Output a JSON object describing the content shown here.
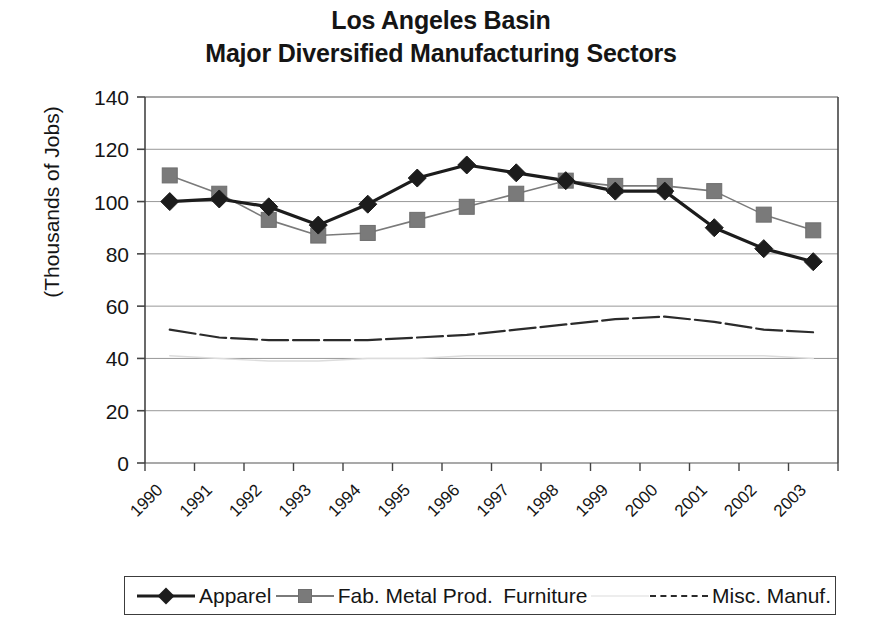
{
  "chart_data": {
    "type": "line",
    "title": "Los Angeles Basin",
    "subtitle": "Major Diversified Manufacturing Sectors",
    "title_lines": [
      "Los Angeles Basin",
      "Major Diversified Manufacturing Sectors"
    ],
    "xlabel": "",
    "ylabel": "(Thousands of Jobs)",
    "ylim": [
      0,
      140
    ],
    "ytick_step": 20,
    "ytick_labels": [
      "140",
      "120",
      "100",
      "80",
      "60",
      "40",
      "20",
      "0"
    ],
    "ytick_values": [
      140,
      120,
      100,
      80,
      60,
      40,
      20,
      0
    ],
    "categories": [
      "1990",
      "1991",
      "1992",
      "1993",
      "1994",
      "1995",
      "1996",
      "1997",
      "1998",
      "1999",
      "2000",
      "2001",
      "2002",
      "2003"
    ],
    "x_tick_rotation_deg": 45,
    "grid": "horizontal",
    "legend_position": "bottom",
    "series": [
      {
        "name": "Apparel",
        "marker": "diamond",
        "color": "#1c1c1c",
        "line_width": 3.2,
        "dash": "solid",
        "values": [
          100,
          101,
          98,
          91,
          99,
          109,
          114,
          111,
          108,
          104,
          104,
          90,
          82,
          77
        ]
      },
      {
        "name": "Fab. Metal Prod.",
        "marker": "square",
        "color": "#7a7a7a",
        "line_width": 1.6,
        "dash": "solid",
        "values": [
          110,
          103,
          93,
          87,
          88,
          93,
          98,
          103,
          108,
          106,
          106,
          104,
          95,
          89
        ]
      },
      {
        "name": "Furniture",
        "marker": "none",
        "color": "#dcdcdc",
        "line_width": 1.4,
        "dash": "solid",
        "values": [
          41,
          40,
          39,
          39,
          40,
          40,
          41,
          41,
          41,
          41,
          41,
          41,
          41,
          40
        ]
      },
      {
        "name": "Misc. Manuf.",
        "marker": "none",
        "color": "#2b2b2b",
        "line_width": 2.2,
        "dash": "dashed",
        "values": [
          51,
          48,
          47,
          47,
          47,
          48,
          49,
          51,
          53,
          55,
          56,
          54,
          51,
          50
        ]
      }
    ]
  },
  "legend": {
    "items": [
      {
        "label": "Apparel",
        "marker": "diamond-marker-icon"
      },
      {
        "label": "Fab. Metal Prod.",
        "marker": "square-marker-icon"
      },
      {
        "label": "Furniture",
        "marker": "faint-line-marker-icon"
      },
      {
        "label": "Misc. Manuf.",
        "marker": "dashed-line-marker-icon"
      }
    ]
  },
  "colors": {
    "apparel": "#1c1c1c",
    "fab_metal": "#7a7a7a",
    "furniture": "#dcdcdc",
    "misc_manuf": "#2b2b2b",
    "axis": "#444444",
    "grid": "#8c8c8c",
    "text": "#151515",
    "background": "#ffffff"
  }
}
